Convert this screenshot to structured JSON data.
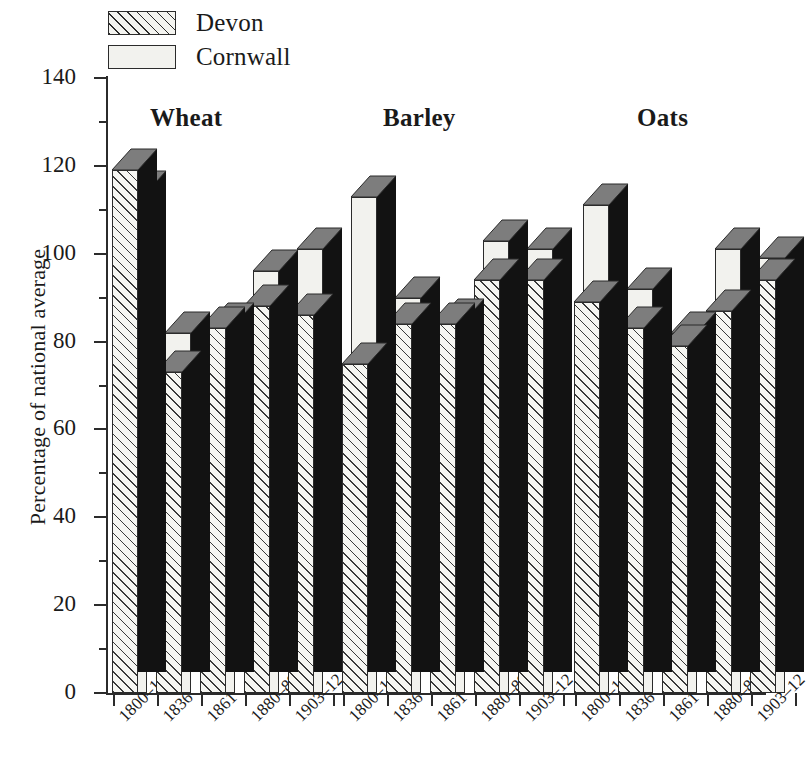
{
  "legend": {
    "items": [
      {
        "label": "Devon",
        "pattern": "hatched"
      },
      {
        "label": "Cornwall",
        "pattern": "plain"
      }
    ]
  },
  "chart_data": {
    "type": "bar",
    "title": "",
    "xlabel": "",
    "ylabel": "Percentage of national average",
    "ylim": [
      0,
      140
    ],
    "yticks": [
      0,
      20,
      40,
      60,
      80,
      100,
      120,
      140
    ],
    "yticks_minor": [
      10,
      30,
      50,
      70,
      90,
      110,
      130
    ],
    "grid": false,
    "legend_position": "top-left",
    "categories": [
      "1800–16",
      "1836",
      "1861",
      "1880–89",
      "1903–12"
    ],
    "groups": [
      {
        "name": "Wheat",
        "series": [
          {
            "name": "Devon",
            "values": [
              119,
              73,
              83,
              88,
              86
            ]
          },
          {
            "name": "Cornwall",
            "values": [
              114,
              82,
              84,
              96,
              101
            ]
          }
        ]
      },
      {
        "name": "Barley",
        "series": [
          {
            "name": "Devon",
            "values": [
              75,
              84,
              84,
              94,
              94
            ]
          },
          {
            "name": "Cornwall",
            "values": [
              113,
              90,
              85,
              103,
              101
            ]
          }
        ]
      },
      {
        "name": "Oats",
        "series": [
          {
            "name": "Devon",
            "values": [
              89,
              83,
              79,
              87,
              94
            ]
          },
          {
            "name": "Cornwall",
            "values": [
              111,
              92,
              82,
              101,
              99
            ]
          }
        ]
      }
    ],
    "colors": {
      "devon_fill": "#f6f6f2",
      "cornwall_fill": "#f2f2ee",
      "bar_side": "#121212",
      "bar_top": "#7d7d7d",
      "outline": "#2b2b2b"
    }
  }
}
